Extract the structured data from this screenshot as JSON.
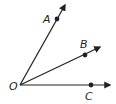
{
  "diagram": {
    "title": "",
    "vertex": {
      "label": "O",
      "x": 20,
      "y": 85,
      "label_x": 10,
      "label_y": 90
    },
    "rays": [
      {
        "name": "OA",
        "point_label": "A",
        "dot": [
          57,
          19
        ],
        "tip": [
          65,
          5
        ],
        "label_x": 43,
        "label_y": 23
      },
      {
        "name": "OB",
        "point_label": "B",
        "dot": [
          85,
          55
        ],
        "tip": [
          100,
          47
        ],
        "label_x": 80,
        "label_y": 48
      },
      {
        "name": "OC",
        "point_label": "C",
        "dot": [
          91,
          85
        ],
        "tip": [
          110,
          85
        ],
        "label_x": 85,
        "label_y": 100
      }
    ],
    "colors": {
      "stroke": "#222222",
      "background": "#ffffff"
    }
  }
}
